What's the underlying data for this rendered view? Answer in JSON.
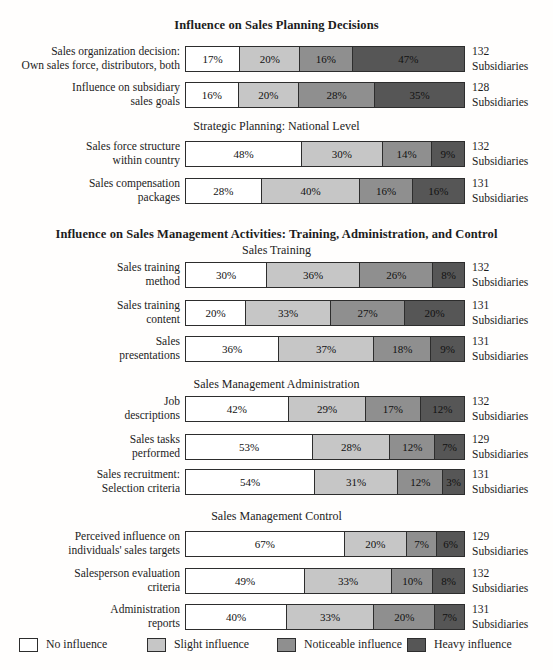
{
  "titles": {
    "planning": "Influence on Sales Planning Decisions",
    "strategic": "Strategic Planning: National Level",
    "management": "Influence on Sales Management Activities: Training, Administration, and Control",
    "training": "Sales Training",
    "administration": "Sales Management Administration",
    "control": "Sales Management Control"
  },
  "legend": {
    "items": [
      {
        "label": "No influence",
        "color": "#ffffff"
      },
      {
        "label": "Slight influence",
        "color": "#c6c6c6"
      },
      {
        "label": "Noticeable influence",
        "color": "#8f8f8f"
      },
      {
        "label": "Heavy influence",
        "color": "#565656"
      }
    ]
  },
  "chart_data": {
    "type": "bar",
    "orientation": "horizontal",
    "stacked": true,
    "unit": "percent",
    "x_range": [
      0,
      100
    ],
    "grid": false,
    "legend_position": "bottom",
    "series_labels": [
      "No influence",
      "Slight influence",
      "Noticeable influence",
      "Heavy influence"
    ],
    "colors": [
      "#ffffff",
      "#c6c6c6",
      "#8f8f8f",
      "#565656"
    ],
    "sections": [
      {
        "title": "Influence on Sales Planning Decisions",
        "subsections": [
          "(none)",
          "Strategic Planning: National Level"
        ]
      },
      {
        "title": "Influence on Sales Management Activities: Training, Administration, and Control",
        "subsections": [
          "Sales Training",
          "Sales Management Administration",
          "Sales Management Control"
        ]
      }
    ],
    "rows": [
      {
        "label": "Sales organization decision:\nOwn sales force, distributors, both",
        "values": [
          17,
          20,
          16,
          47
        ],
        "count": "132\nSubsidiaries"
      },
      {
        "label": "Influence on subsidiary\nsales goals",
        "values": [
          16,
          20,
          28,
          35
        ],
        "count": "128\nSubsidiaries"
      },
      {
        "label": "Sales force structure\nwithin country",
        "values": [
          48,
          30,
          14,
          9
        ],
        "count": "132\nSubsidiaries"
      },
      {
        "label": "Sales compensation\npackages",
        "values": [
          28,
          40,
          16,
          16
        ],
        "count": "131\nSubsidiaries"
      },
      {
        "label": "Sales training\nmethod",
        "values": [
          30,
          36,
          26,
          8
        ],
        "count": "132\nSubsidiaries"
      },
      {
        "label": "Sales training\ncontent",
        "values": [
          20,
          33,
          27,
          20
        ],
        "count": "131\nSubsidiaries"
      },
      {
        "label": "Sales\npresentations",
        "values": [
          36,
          37,
          18,
          9
        ],
        "count": "131\nSubsidiaries"
      },
      {
        "label": "Job\ndescriptions",
        "values": [
          42,
          29,
          17,
          12
        ],
        "count": "132\nSubsidiaries"
      },
      {
        "label": "Sales tasks\nperformed",
        "values": [
          53,
          28,
          12,
          7
        ],
        "count": "129\nSubsidiaries"
      },
      {
        "label": "Sales recruitment:\nSelection criteria",
        "values": [
          54,
          31,
          12,
          3
        ],
        "count": "131\nSubsidiaries"
      },
      {
        "label": "Perceived influence on\nindividuals' sales targets",
        "values": [
          67,
          20,
          7,
          6
        ],
        "count": "129\nSubsidiaries"
      },
      {
        "label": "Salesperson evaluation\ncriteria",
        "values": [
          49,
          33,
          10,
          8
        ],
        "count": "132\nSubsidiaries"
      },
      {
        "label": "Administration\nreports",
        "values": [
          40,
          33,
          20,
          7
        ],
        "count": "131\nSubsidiaries"
      }
    ]
  }
}
